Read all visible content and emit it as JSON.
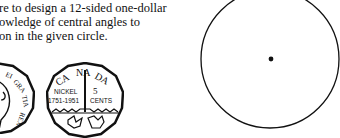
{
  "text": {
    "lines": [
      "re to design a 12-sided one-dollar",
      "owledge of central angles to",
      "on in the given circle."
    ]
  },
  "coins": {
    "left": {
      "legend": "DEI GRATIA REX"
    },
    "right": {
      "top": "CANADA",
      "left_top": "NICKEL",
      "left_bottom": "1751-1951",
      "right_top": "5",
      "right_bottom": "CENTS"
    }
  }
}
